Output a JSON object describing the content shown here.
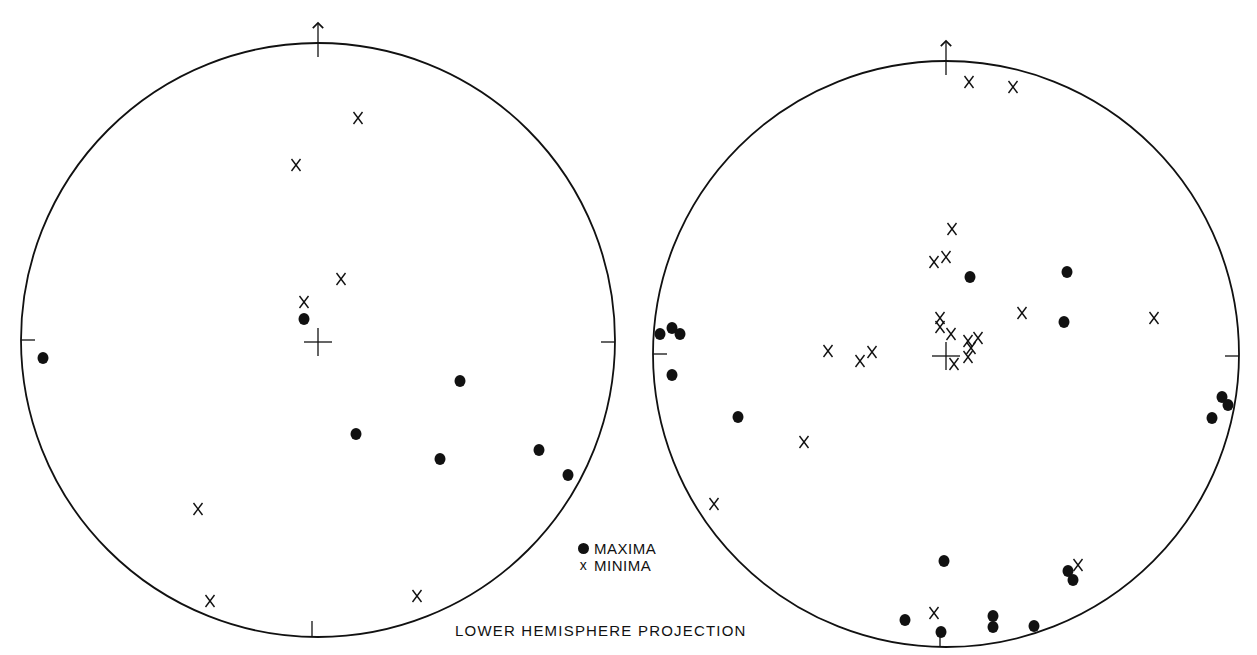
{
  "figure": {
    "caption": "LOWER HEMISPHERE PROJECTION",
    "colors": {
      "ink": "#111111",
      "background": "#ffffff"
    }
  },
  "legend": {
    "items": [
      {
        "symbol": "filled-circle",
        "label": "MAXIMA"
      },
      {
        "symbol": "x-mark",
        "label": "MINIMA"
      }
    ]
  },
  "chart_data": [
    {
      "type": "scatter",
      "title": "Stereonet (left)",
      "projection": "lower hemisphere",
      "north_arrow": true,
      "circle": {
        "cx": 318,
        "cy": 340,
        "r": 297
      },
      "series": [
        {
          "name": "MAXIMA",
          "marker": "filled-circle",
          "points_px": [
            [
              304,
              319
            ],
            [
              43,
              358
            ],
            [
              460,
              381
            ],
            [
              356,
              434
            ],
            [
              440,
              459
            ],
            [
              539,
              450
            ],
            [
              568,
              475
            ]
          ]
        },
        {
          "name": "MINIMA",
          "marker": "x",
          "points_px": [
            [
              358,
              118
            ],
            [
              296,
              165
            ],
            [
              341,
              279
            ],
            [
              304,
              302
            ],
            [
              198,
              509
            ],
            [
              210,
              601
            ],
            [
              417,
              596
            ]
          ]
        }
      ]
    },
    {
      "type": "scatter",
      "title": "Stereonet (right)",
      "projection": "lower hemisphere",
      "north_arrow": true,
      "circle": {
        "cx": 946,
        "cy": 354,
        "r": 293
      },
      "series": [
        {
          "name": "MAXIMA",
          "marker": "filled-circle",
          "points_px": [
            [
              970,
              277
            ],
            [
              1067,
              272
            ],
            [
              1064,
              322
            ],
            [
              660,
              334
            ],
            [
              672,
              328
            ],
            [
              680,
              334
            ],
            [
              672,
              375
            ],
            [
              738,
              417
            ],
            [
              1222,
              397
            ],
            [
              1228,
              405
            ],
            [
              1212,
              418
            ],
            [
              944,
              561
            ],
            [
              1068,
              571
            ],
            [
              1073,
              580
            ],
            [
              905,
              620
            ],
            [
              941,
              632
            ],
            [
              993,
              616
            ],
            [
              993,
              627
            ],
            [
              1034,
              626
            ]
          ]
        },
        {
          "name": "MINIMA",
          "marker": "x",
          "points_px": [
            [
              969,
              82
            ],
            [
              1013,
              87
            ],
            [
              952,
              229
            ],
            [
              934,
              262
            ],
            [
              946,
              257
            ],
            [
              940,
              318
            ],
            [
              940,
              327
            ],
            [
              951,
              334
            ],
            [
              968,
              341
            ],
            [
              978,
              338
            ],
            [
              971,
              348
            ],
            [
              968,
              357
            ],
            [
              954,
              364
            ],
            [
              1022,
              313
            ],
            [
              1154,
              318
            ],
            [
              828,
              351
            ],
            [
              860,
              361
            ],
            [
              872,
              352
            ],
            [
              804,
              442
            ],
            [
              714,
              504
            ],
            [
              934,
              613
            ],
            [
              1078,
              565
            ]
          ]
        }
      ]
    }
  ]
}
